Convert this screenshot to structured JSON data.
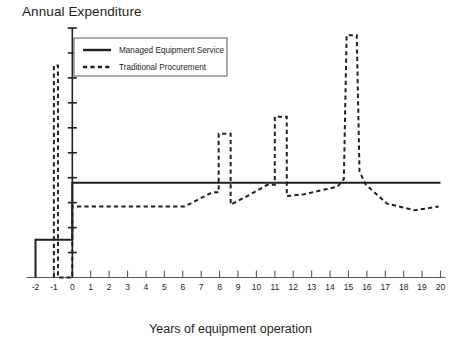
{
  "chart_data": {
    "type": "line",
    "title": "Annual Expenditure",
    "xlabel": "Years of equipment operation",
    "ylabel": "Annual Expenditure",
    "grid": false,
    "legend_position": "top-left-inside",
    "xlim": [
      -2,
      20
    ],
    "ylim": [
      0,
      1.35
    ],
    "x_ticks": [
      "-2",
      "-1",
      "0",
      "1",
      "2",
      "3",
      "4",
      "5",
      "6",
      "7",
      "8",
      "9",
      "10",
      "11",
      "12",
      "13",
      "14",
      "15",
      "16",
      "17",
      "18",
      "19",
      "20"
    ],
    "y_ticks_labeled": false,
    "y_axis_note": "unlabelled axis with 10 evenly spaced tick marks",
    "series": [
      {
        "name": "Managed Equipment Service",
        "style": "solid",
        "color": "#231f20",
        "points": [
          {
            "x": -2,
            "y": 0.0
          },
          {
            "x": -2,
            "y": 0.2
          },
          {
            "x": 0,
            "y": 0.2
          },
          {
            "x": 0,
            "y": 0.5
          },
          {
            "x": 20,
            "y": 0.5
          }
        ]
      },
      {
        "name": "Traditional Procurement",
        "style": "dashed",
        "color": "#231f20",
        "points": [
          {
            "x": -1,
            "y": 0.0
          },
          {
            "x": -1,
            "y": 1.12
          },
          {
            "x": -0.78,
            "y": 1.12
          },
          {
            "x": -0.78,
            "y": 0.0
          },
          {
            "x": 0,
            "y": 0.0
          },
          {
            "x": 0,
            "y": 0.375
          },
          {
            "x": 6.1,
            "y": 0.375
          },
          {
            "x": 7.6,
            "y": 0.45
          },
          {
            "x": 7.95,
            "y": 0.45
          },
          {
            "x": 7.95,
            "y": 0.76
          },
          {
            "x": 8.6,
            "y": 0.76
          },
          {
            "x": 8.6,
            "y": 0.385
          },
          {
            "x": 9.5,
            "y": 0.43
          },
          {
            "x": 10.6,
            "y": 0.49
          },
          {
            "x": 11.0,
            "y": 0.49
          },
          {
            "x": 11.0,
            "y": 0.85
          },
          {
            "x": 11.65,
            "y": 0.85
          },
          {
            "x": 11.65,
            "y": 0.43
          },
          {
            "x": 12.6,
            "y": 0.44
          },
          {
            "x": 14.4,
            "y": 0.48
          },
          {
            "x": 14.75,
            "y": 0.52
          },
          {
            "x": 14.9,
            "y": 1.28
          },
          {
            "x": 15.45,
            "y": 1.28
          },
          {
            "x": 15.6,
            "y": 0.56
          },
          {
            "x": 15.95,
            "y": 0.49
          },
          {
            "x": 17.1,
            "y": 0.39
          },
          {
            "x": 18.6,
            "y": 0.355
          },
          {
            "x": 19.9,
            "y": 0.375
          }
        ]
      }
    ],
    "annotations": []
  },
  "legend": {
    "entries": [
      {
        "label": "Managed Equipment Service",
        "style": "solid"
      },
      {
        "label": "Traditional Procurement",
        "style": "dashed"
      }
    ]
  }
}
